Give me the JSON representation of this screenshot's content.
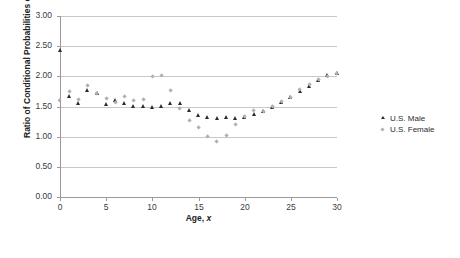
{
  "chart_data": {
    "type": "scatter",
    "title": "",
    "xlabel": "Age, x",
    "xlabel_plain": "Age, ",
    "xlabel_italic": "x",
    "ylabel": "Ratio of Conditional Probabilities of Death",
    "xlim": [
      0,
      30
    ],
    "ylim": [
      0,
      3.0
    ],
    "xticks": [
      0,
      5,
      10,
      15,
      20,
      25,
      30
    ],
    "xtick_labels": [
      "0",
      "5",
      "10",
      "15",
      "20",
      "25",
      "30"
    ],
    "yticks": [
      0.0,
      0.5,
      1.0,
      1.5,
      2.0,
      2.5,
      3.0
    ],
    "ytick_labels": [
      "0.00",
      "0.50",
      "1.00",
      "1.50",
      "2.00",
      "2.50",
      "3.00"
    ],
    "grid": "horizontal",
    "legend_position": "right",
    "x": [
      0,
      1,
      2,
      3,
      4,
      5,
      6,
      7,
      8,
      9,
      10,
      11,
      12,
      13,
      14,
      15,
      16,
      17,
      18,
      19,
      20,
      21,
      22,
      23,
      24,
      25,
      26,
      27,
      28,
      29,
      30
    ],
    "series": [
      {
        "name": "U.S. Male",
        "marker": "triangle",
        "color": "#2b2b2b",
        "values": [
          2.43,
          1.67,
          1.56,
          1.78,
          1.73,
          1.54,
          1.61,
          1.55,
          1.5,
          1.5,
          1.49,
          1.51,
          1.55,
          1.56,
          1.44,
          1.35,
          1.33,
          1.31,
          1.32,
          1.31,
          1.32,
          1.37,
          1.43,
          1.49,
          1.57,
          1.66,
          1.75,
          1.84,
          1.94,
          2.02,
          2.05
        ]
      },
      {
        "name": "U.S. Female",
        "marker": "diamond",
        "color": "#b0b0b0",
        "values": [
          1.6,
          1.74,
          1.61,
          1.85,
          1.71,
          1.63,
          1.57,
          1.67,
          1.6,
          1.62,
          1.99,
          2.01,
          1.77,
          1.47,
          1.27,
          1.15,
          1.0,
          0.92,
          1.02,
          1.2,
          1.34,
          1.44,
          1.41,
          1.5,
          1.58,
          1.64,
          1.78,
          1.86,
          1.94,
          2.0,
          2.04
        ]
      }
    ]
  },
  "legend": {
    "items": [
      {
        "label": "U.S. Male"
      },
      {
        "label": "U.S. Female"
      }
    ]
  }
}
